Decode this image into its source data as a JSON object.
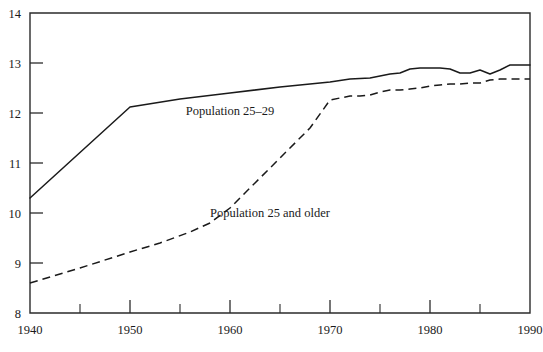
{
  "chart_data": {
    "type": "line",
    "title": "",
    "subtitle": "",
    "xlabel": "",
    "ylabel": "",
    "xlim": [
      1940,
      1990
    ],
    "ylim": [
      8,
      14
    ],
    "grid": false,
    "legend_position": "inline-annotation",
    "x_ticks_major": [
      1940,
      1950,
      1960,
      1970,
      1980,
      1990
    ],
    "x_ticks_minor": [
      1945,
      1955,
      1965,
      1975,
      1985
    ],
    "x_tick_labels": [
      "1940",
      "1950",
      "1960",
      "1970",
      "1980",
      "1990"
    ],
    "y_ticks": [
      8,
      9,
      10,
      11,
      12,
      13,
      14
    ],
    "y_tick_labels": [
      "8",
      "9",
      "10",
      "11",
      "12",
      "13",
      "14"
    ],
    "series": [
      {
        "name": "Population 25–29",
        "style": "solid",
        "color": "#1a1a1a",
        "label_text": "Population 25–29",
        "x": [
          1940,
          1950,
          1955,
          1960,
          1965,
          1968,
          1970,
          1972,
          1974,
          1975,
          1976,
          1977,
          1978,
          1979,
          1980,
          1981,
          1982,
          1983,
          1984,
          1985,
          1986,
          1987,
          1988,
          1989,
          1990
        ],
        "values": [
          10.3,
          12.12,
          12.28,
          12.4,
          12.52,
          12.58,
          12.62,
          12.68,
          12.7,
          12.74,
          12.78,
          12.8,
          12.88,
          12.9,
          12.9,
          12.9,
          12.88,
          12.8,
          12.8,
          12.86,
          12.78,
          12.86,
          12.96,
          12.96,
          12.96
        ]
      },
      {
        "name": "Population 25 and older",
        "style": "dashed",
        "color": "#1a1a1a",
        "label_text": "Population 25 and older",
        "x": [
          1940,
          1945,
          1950,
          1953,
          1956,
          1958,
          1960,
          1962,
          1964,
          1966,
          1968,
          1970,
          1971,
          1972,
          1973,
          1974,
          1975,
          1976,
          1977,
          1978,
          1979,
          1980,
          1981,
          1982,
          1983,
          1984,
          1985,
          1986,
          1987,
          1988,
          1989,
          1990
        ],
        "values": [
          8.6,
          8.9,
          9.22,
          9.4,
          9.62,
          9.8,
          10.1,
          10.5,
          10.9,
          11.3,
          11.7,
          12.26,
          12.3,
          12.34,
          12.34,
          12.36,
          12.42,
          12.46,
          12.46,
          12.48,
          12.5,
          12.54,
          12.56,
          12.58,
          12.58,
          12.6,
          12.6,
          12.66,
          12.68,
          12.68,
          12.68,
          12.68
        ]
      }
    ],
    "annotations": [
      {
        "text": "Population 25–29",
        "x": 1960,
        "y": 11.97,
        "anchor": "middle"
      },
      {
        "text": "Population 25 and older",
        "x": 1964,
        "y": 9.92,
        "anchor": "middle"
      }
    ]
  },
  "axes": {
    "y_title": "",
    "x_title": "",
    "y_max_label": "14",
    "y_min_label": "8",
    "x_min_label": "1940",
    "x_max_label": "1990"
  },
  "colors": {
    "background": "#ffffff",
    "axis": "#2b2b2b",
    "ink": "#1a1a1a"
  }
}
